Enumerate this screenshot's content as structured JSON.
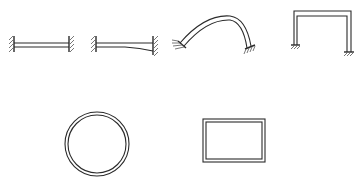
{
  "diagram": {
    "elements": [
      {
        "id": "fixed-fixed-beam-uniform",
        "label": "fixed-fixed straight beam (uniform section)"
      },
      {
        "id": "fixed-fixed-beam-tapered",
        "label": "fixed-fixed tapered beam (variable section)"
      },
      {
        "id": "curved-arch",
        "label": "fixed-support curved arch"
      },
      {
        "id": "portal-frame",
        "label": "portal frame with fixed bases"
      },
      {
        "id": "closed-ring",
        "label": "closed circular ring"
      },
      {
        "id": "closed-rect-frame",
        "label": "closed rectangular frame"
      }
    ],
    "colors": {
      "line": "#2a2a2a",
      "hatch": "#555555",
      "background": "#ffffff"
    }
  }
}
